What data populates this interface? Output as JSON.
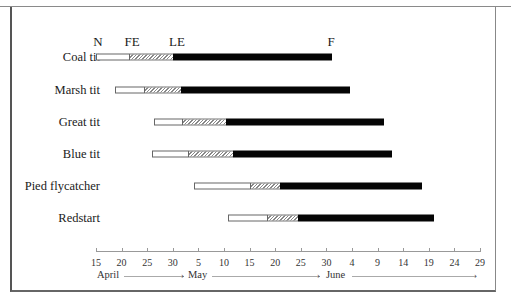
{
  "chart_data": {
    "type": "bar",
    "subtype": "horizontal-stacked-timeline",
    "title": "",
    "xlabel": "Date (April - June)",
    "ylabel": "",
    "phase_labels": [
      "N",
      "FE",
      "LE",
      "F"
    ],
    "phase_legend": {
      "N": "Nest building (open bar)",
      "FE": "First egg (hatched bar = laying)",
      "LE": "Last egg (black bar = incubation/nestling)",
      "F": "Fledging"
    },
    "x_ticks": [
      "15",
      "20",
      "25",
      "30",
      "5",
      "10",
      "15",
      "20",
      "25",
      "30",
      "4",
      "9",
      "14",
      "19",
      "24",
      "29"
    ],
    "x_tick_days": [
      0,
      5,
      10,
      15,
      20,
      25,
      30,
      35,
      40,
      45,
      50,
      55,
      60,
      65,
      70,
      75
    ],
    "months": [
      "April",
      "May",
      "June"
    ],
    "x_unit": "days since 15 April",
    "xlim": [
      0,
      75
    ],
    "categories": [
      "Coal tit",
      "Marsh tit",
      "Great tit",
      "Blue tit",
      "Pied flycatcher",
      "Redstart"
    ],
    "series": [
      {
        "name": "N (start)",
        "values": [
          0,
          3.7,
          11.3,
          10.9,
          19.1,
          25.8
        ]
      },
      {
        "name": "FE (first egg)",
        "values": [
          6.6,
          9.6,
          17.0,
          18.2,
          30.3,
          33.6
        ]
      },
      {
        "name": "LE (last egg)",
        "values": [
          15.0,
          16.6,
          25.4,
          26.8,
          36.0,
          39.4
        ]
      },
      {
        "name": "F (fledging)",
        "values": [
          46.0,
          49.6,
          56.3,
          57.8,
          63.7,
          66.0
        ]
      }
    ],
    "grid": false,
    "legend_position": "top (phase letters above first bar)"
  },
  "labels": {
    "N": "N",
    "FE": "FE",
    "LE": "LE",
    "F": "F",
    "rows": [
      "Coal tit",
      "Marsh tit",
      "Great tit",
      "Blue tit",
      "Pied flycatcher",
      "Redstart"
    ],
    "ticks": [
      "15",
      "20",
      "25",
      "30",
      "5",
      "10",
      "15",
      "20",
      "25",
      "30",
      "4",
      "9",
      "14",
      "19",
      "24",
      "29"
    ],
    "months": {
      "april": "April",
      "may": "May",
      "june": "June"
    },
    "arrow": "›"
  }
}
